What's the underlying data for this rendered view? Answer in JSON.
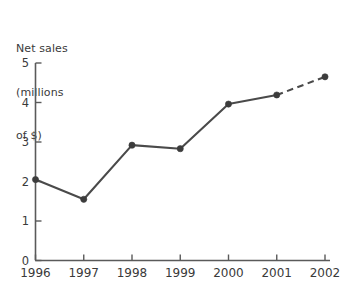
{
  "chart_data": {
    "type": "line",
    "title": "",
    "xlabel": "",
    "ylabel": "Net sales (millions of $)",
    "ylabel_lines": [
      "Net sales",
      "(millions",
      "of $)"
    ],
    "categories": [
      "1996",
      "1997",
      "1998",
      "1999",
      "2000",
      "2001",
      "2002"
    ],
    "values": [
      2.05,
      1.55,
      2.92,
      2.83,
      3.96,
      4.19,
      4.65
    ],
    "series": [
      {
        "name": "Net sales",
        "values": [
          2.05,
          1.55,
          2.92,
          2.83,
          3.96,
          4.19,
          4.65
        ]
      }
    ],
    "ylim": [
      0,
      5
    ],
    "xlim": [
      "1996",
      "2002"
    ],
    "ytick_labels": [
      "0",
      "1",
      "2",
      "3",
      "4",
      "5"
    ],
    "ytick_values": [
      0,
      1,
      2,
      3,
      4,
      5
    ],
    "xtick_labels": [
      "1996",
      "1997",
      "1998",
      "1999",
      "2000",
      "2001",
      "2002"
    ],
    "grid": false,
    "legend": false,
    "legend_position": "none",
    "dashed_segments": [
      {
        "from": "2001",
        "to": "2002",
        "note": "projected"
      }
    ],
    "line_color": "#4a4a4a",
    "marker_color": "#3c3c3c",
    "axis_color": "#5a5a5a",
    "background_color": "#ffffff",
    "marker": "circle"
  }
}
